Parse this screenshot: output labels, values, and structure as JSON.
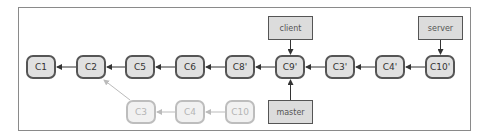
{
  "diagram": {
    "type": "git-commit-graph",
    "main_commits": [
      {
        "id": "C1",
        "cx": 41,
        "cy": 67
      },
      {
        "id": "C2",
        "cx": 91,
        "cy": 67
      },
      {
        "id": "C5",
        "cx": 140,
        "cy": 67
      },
      {
        "id": "C6",
        "cx": 190,
        "cy": 67
      },
      {
        "id": "C8'",
        "cx": 240,
        "cy": 67
      },
      {
        "id": "C9'",
        "cx": 290,
        "cy": 67
      },
      {
        "id": "C3'",
        "cx": 340,
        "cy": 67
      },
      {
        "id": "C4'",
        "cx": 390,
        "cy": 67
      },
      {
        "id": "C10'",
        "cx": 440,
        "cy": 67
      }
    ],
    "ghost_commits": [
      {
        "id": "C3",
        "cx": 141,
        "cy": 112
      },
      {
        "id": "C4",
        "cx": 190,
        "cy": 112
      },
      {
        "id": "C10",
        "cx": 240,
        "cy": 112
      }
    ],
    "refs": [
      {
        "name": "client",
        "x": 268,
        "y": 16,
        "w": 45,
        "h": 24,
        "points_to": "C9'"
      },
      {
        "name": "server",
        "x": 418,
        "y": 16,
        "w": 45,
        "h": 24,
        "points_to": "C10'"
      },
      {
        "name": "master",
        "x": 268,
        "y": 100,
        "w": 45,
        "h": 24,
        "points_to": "C9'"
      }
    ],
    "edges": [
      {
        "from": "C2",
        "to": "C1"
      },
      {
        "from": "C5",
        "to": "C2"
      },
      {
        "from": "C6",
        "to": "C5"
      },
      {
        "from": "C8'",
        "to": "C6"
      },
      {
        "from": "C9'",
        "to": "C8'"
      },
      {
        "from": "C3'",
        "to": "C9'"
      },
      {
        "from": "C4'",
        "to": "C3'"
      },
      {
        "from": "C10'",
        "to": "C4'"
      },
      {
        "from": "C4",
        "to": "C3",
        "ghost": true
      },
      {
        "from": "C10",
        "to": "C4",
        "ghost": true
      },
      {
        "from": "C3",
        "to": "C2",
        "ghost": true
      }
    ],
    "colors": {
      "commit_fill": "#e0e0e0",
      "commit_border": "#555555",
      "ghost_fill": "#f1f1f1",
      "ghost_border": "#bdbdbd",
      "ref_fill": "#dcdcdc",
      "arrow": "#333333",
      "ghost_arrow": "#bbbbbb"
    }
  }
}
